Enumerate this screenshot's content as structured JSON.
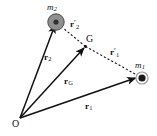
{
  "figure": {
    "type": "vector-diagram",
    "background_color": "#ffffff",
    "line_color": "#111111",
    "body_fill_color": "#8c8c8c",
    "width": 157,
    "height": 136
  },
  "points": {
    "origin": {
      "label": "O",
      "x": 20,
      "y": 118
    },
    "m2": {
      "label": "m",
      "subscript": "2",
      "x": 56,
      "y": 22
    },
    "m1": {
      "label": "m",
      "subscript": "1",
      "x": 142,
      "y": 78
    },
    "centre_of_mass": {
      "label": "G",
      "x": 85,
      "y": 46
    }
  },
  "vectors": [
    {
      "name": "r2",
      "symbol": "r",
      "subscript": "2",
      "prime": "",
      "style": "solid",
      "from": "origin",
      "to": "m2",
      "label_x": 44,
      "label_y": 53
    },
    {
      "name": "rG",
      "symbol": "r",
      "subscript": "G",
      "prime": "",
      "style": "solid",
      "from": "origin",
      "to": "centre_of_mass",
      "label_x": 64,
      "label_y": 77
    },
    {
      "name": "r1",
      "symbol": "r",
      "subscript": "1",
      "prime": "",
      "style": "solid",
      "from": "origin",
      "to": "m1",
      "label_x": 85,
      "label_y": 102
    },
    {
      "name": "r2prime",
      "symbol": "r",
      "subscript": "2",
      "prime": "′",
      "style": "dashed",
      "from": "centre_of_mass",
      "to": "m2",
      "label_x": 70,
      "label_y": 21
    },
    {
      "name": "r1prime",
      "symbol": "r",
      "subscript": "1",
      "prime": "′",
      "style": "dashed",
      "from": "centre_of_mass",
      "to": "m1",
      "label_x": 110,
      "label_y": 49
    }
  ],
  "labels": {
    "origin": "O",
    "centre_of_mass": "G",
    "mass_symbol": "m",
    "mass2_sub": "2",
    "mass1_sub": "1",
    "vector_symbol": "r",
    "sub_2": "2",
    "sub_1": "1",
    "sub_G": "G",
    "prime_mark": "′"
  }
}
